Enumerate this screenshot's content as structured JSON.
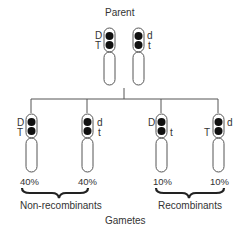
{
  "title": "Parent",
  "parent": {
    "chromosomes": [
      {
        "top_allele": "D",
        "bottom_allele": "T",
        "label_side": "left"
      },
      {
        "top_allele": "d",
        "bottom_allele": "t",
        "label_side": "right"
      }
    ]
  },
  "gametes": [
    {
      "top_allele": "D",
      "bottom_allele": "T",
      "top_side": "left",
      "bottom_side": "left",
      "percent": "40%"
    },
    {
      "top_allele": "d",
      "bottom_allele": "t",
      "top_side": "right",
      "bottom_side": "right",
      "percent": "40%"
    },
    {
      "top_allele": "D",
      "bottom_allele": "t",
      "top_side": "left",
      "bottom_side": "right",
      "percent": "10%"
    },
    {
      "top_allele": "d",
      "bottom_allele": "T",
      "top_side": "right",
      "bottom_side": "left",
      "percent": "10%"
    }
  ],
  "groups": {
    "non_recombinants": "Non-recombinants",
    "recombinants": "Recombinants"
  },
  "footer": "Gametes",
  "colors": {
    "line": "#555555",
    "gene_dot": "#111111",
    "text": "#333333"
  }
}
